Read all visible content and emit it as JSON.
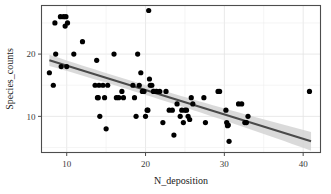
{
  "chart_data": {
    "type": "scatter",
    "title": "",
    "xlabel": "N_deposition",
    "ylabel": "Species_counts",
    "xlim": [
      6.8,
      42.2
    ],
    "ylim": [
      4.2,
      27.8
    ],
    "xticks": [
      10,
      20,
      30,
      40
    ],
    "yticks": [
      10,
      20
    ],
    "xtick_labels": [
      "10",
      "20",
      "30",
      "40"
    ],
    "ytick_labels": [
      "10",
      "20"
    ],
    "grid": true,
    "grid_major_color": "#e3e3e3",
    "panel_background": "#ffffff",
    "panel_border_color": "#4d4d4d",
    "point_color": "#000000",
    "point_size_px": 4,
    "legend": "none",
    "series": [
      {
        "name": "observations",
        "x": [
          7.8,
          8.3,
          8.5,
          8.6,
          9.2,
          9.3,
          9.6,
          9.8,
          9.9,
          10.0,
          10.1,
          10.9,
          12.0,
          13.6,
          13.8,
          13.9,
          14.0,
          14.1,
          14.2,
          14.6,
          14.8,
          15.0,
          15.2,
          16.0,
          16.3,
          16.6,
          17.0,
          17.2,
          18.4,
          18.6,
          18.8,
          19.0,
          19.2,
          19.4,
          19.6,
          19.8,
          20.0,
          20.2,
          20.3,
          20.4,
          20.5,
          20.6,
          20.8,
          21.0,
          21.4,
          21.8,
          22.2,
          22.6,
          23.0,
          23.4,
          23.6,
          24.0,
          24.4,
          24.6,
          24.8,
          25.0,
          25.2,
          25.4,
          25.6,
          25.8,
          26.0,
          27.4,
          27.6,
          29.2,
          29.4,
          30.2,
          30.3,
          30.4,
          30.5,
          30.6,
          31.8,
          32.2,
          32.6,
          32.8,
          33.0,
          40.8
        ],
        "y": [
          17.0,
          15.0,
          25.0,
          20.0,
          26.0,
          18.0,
          26.0,
          24.5,
          26.0,
          18.0,
          25.0,
          20.0,
          22.0,
          15.0,
          19.0,
          13.0,
          13.0,
          15.0,
          10.0,
          15.0,
          13.0,
          8.0,
          15.0,
          20.0,
          13.0,
          13.0,
          14.0,
          13.0,
          15.0,
          13.0,
          10.0,
          20.0,
          15.0,
          17.0,
          14.0,
          14.0,
          10.0,
          11.0,
          11.0,
          27.0,
          16.0,
          15.0,
          15.0,
          14.0,
          14.0,
          14.0,
          9.0,
          14.0,
          11.0,
          11.0,
          7.0,
          12.0,
          10.0,
          11.0,
          9.0,
          11.0,
          11.0,
          10.0,
          9.5,
          13.0,
          12.0,
          13.0,
          9.0,
          14.0,
          14.0,
          11.0,
          9.0,
          8.5,
          8.6,
          6.0,
          12.0,
          12.0,
          9.0,
          9.0,
          10.0,
          14.0
        ]
      }
    ],
    "fit": {
      "type": "linear_smooth",
      "line_color": "#4a4a4a",
      "line_width_px": 2,
      "band_color": "#d4d4d4",
      "x_start": 7.8,
      "x_end": 41.0,
      "y_start": 19.0,
      "y_end": 6.0,
      "band_half_width_start": 0.9,
      "band_half_width_mid": 0.45,
      "band_half_width_end": 1.5
    }
  }
}
